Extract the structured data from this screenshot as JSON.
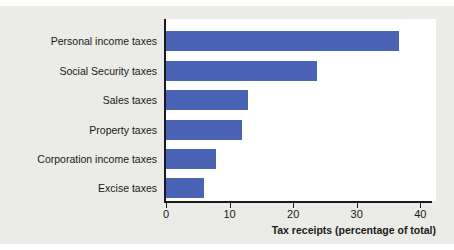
{
  "chart_data": {
    "type": "bar",
    "orientation": "horizontal",
    "title": "",
    "subtitle": "",
    "xlabel": "Tax receipts (percentage of total)",
    "ylabel": "",
    "categories": [
      "Personal income taxes",
      "Social Security taxes",
      "Sales taxes",
      "Property taxes",
      "Corporation income taxes",
      "Excise taxes"
    ],
    "values": [
      36.7,
      23.8,
      12.9,
      11.9,
      7.8,
      6.0
    ],
    "xlim": [
      0,
      42
    ],
    "xticks": [
      0,
      10,
      20,
      30,
      40
    ],
    "xtick_labels": [
      "0",
      "10",
      "20",
      "30",
      "40"
    ],
    "grid": false,
    "legend": null,
    "bar_color": "#4a63b5",
    "axis_color": "#1a1a1a",
    "plot_background": "#ffffff",
    "figure_background": "#ebebe7"
  }
}
